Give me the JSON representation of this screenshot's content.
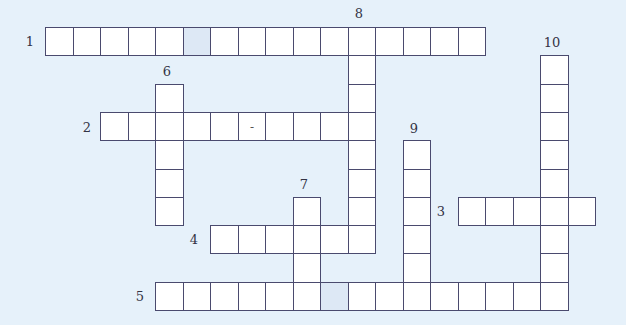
{
  "puzzle": {
    "colors": {
      "background": "#e6f1fa",
      "cell": "#ffffff",
      "shaded_cell": "#dde8f5",
      "border": "#4a4a6e"
    },
    "grid": {
      "origin_x": 45,
      "origin_y": 27,
      "cell_w": 27.5,
      "cell_h": 28.3
    },
    "entries": [
      {
        "number": "1",
        "direction": "across",
        "row": 0,
        "col": 2,
        "length": 16,
        "label_x": 30,
        "label_y": 41,
        "shaded": [
          5
        ],
        "prefill": {}
      },
      {
        "number": "2",
        "direction": "across",
        "row": 3,
        "col": 4,
        "length": 10,
        "label_x": 87,
        "label_y": 127,
        "shaded": [],
        "prefill": {
          "5": "-"
        }
      },
      {
        "number": "3",
        "direction": "across",
        "row": 6,
        "col": 17,
        "length": 5,
        "label_x": 441,
        "label_y": 211,
        "shaded": [],
        "prefill": {}
      },
      {
        "number": "4",
        "direction": "across",
        "row": 7,
        "col": 8,
        "length": 6,
        "label_x": 194,
        "label_y": 239,
        "shaded": [],
        "prefill": {}
      },
      {
        "number": "5",
        "direction": "across",
        "row": 9,
        "col": 6,
        "length": 15,
        "label_x": 140,
        "label_y": 296,
        "shaded": [
          6
        ],
        "prefill": {}
      },
      {
        "number": "6",
        "direction": "down",
        "row": 2,
        "col": 6,
        "length": 5,
        "label_x": 167,
        "label_y": 71,
        "shaded": [],
        "prefill": {}
      },
      {
        "number": "7",
        "direction": "down",
        "row": 6,
        "col": 11,
        "length": 4,
        "label_x": 304,
        "label_y": 184,
        "shaded": [],
        "prefill": {}
      },
      {
        "number": "8",
        "direction": "down",
        "row": 0,
        "col": 13,
        "length": 8,
        "label_x": 359,
        "label_y": 13,
        "shaded": [],
        "prefill": {}
      },
      {
        "number": "9",
        "direction": "down",
        "row": 4,
        "col": 15,
        "length": 6,
        "label_x": 414,
        "label_y": 128,
        "shaded": [],
        "prefill": {}
      },
      {
        "number": "10",
        "direction": "down",
        "row": 1,
        "col": 20,
        "length": 9,
        "label_x": 552,
        "label_y": 42,
        "shaded": [],
        "prefill": {}
      }
    ]
  }
}
